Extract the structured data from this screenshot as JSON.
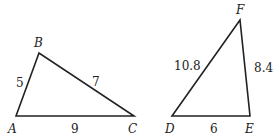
{
  "triangle_abc": {
    "vertices": {
      "A": "A",
      "B": "B",
      "C": "C"
    },
    "sides": {
      "AB": "5",
      "BC": "7",
      "AC": "9"
    }
  },
  "triangle_def": {
    "vertices": {
      "D": "D",
      "E": "E",
      "F": "F"
    },
    "sides": {
      "DF": "10.8",
      "EF": "8.4",
      "DE": "6"
    }
  },
  "colors": {
    "stroke": "#222222",
    "background": "#ffffff"
  }
}
